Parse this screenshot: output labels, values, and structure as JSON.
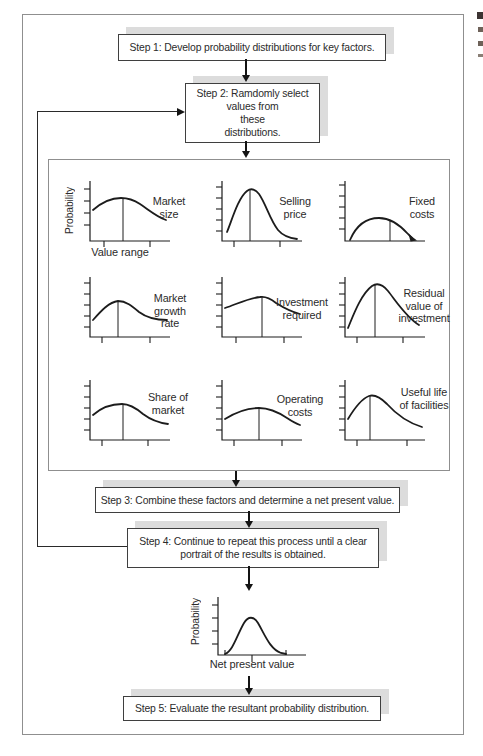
{
  "diagram": {
    "steps": [
      {
        "label": "Step 1: Develop probability distributions for key factors."
      },
      {
        "label": "Step 2: Ramdomly select\nvalues from\nthese\ndistributions."
      },
      {
        "label": "Step 3: Combine these factors and determine a net present value."
      },
      {
        "label": "Step 4: Continue to repeat this process until a clear\nportrait of the results is obtained."
      },
      {
        "label": "Step 5: Evaluate the resultant probability distribution."
      }
    ],
    "colors": {
      "line": "#1c1c1c",
      "box_border": "#3f3f3f",
      "frame": "#8f8f8f",
      "shadow": "#dcdcdc",
      "text": "#2b2b2b"
    }
  },
  "chart_data": {
    "factor_charts": {
      "type": "line",
      "ylabel": "Probability",
      "xlabel": "Value range",
      "items": [
        {
          "label": "Market\nsize",
          "path": "M 15,33 C 23,26 33,21 43,21 C 51,21 56,23 62,27 C 71,33 79,40 88,43",
          "vline": [
            45,
            21
          ],
          "yticks": [
            12,
            24,
            36,
            48
          ],
          "xticks": [
            26,
            72
          ]
        },
        {
          "label": "Selling\nprice",
          "path": "M 17,55 C 22,43 28,21 37,14 C 41,11 45,12 49,17 C 56,27 60,43 68,53 C 73,59 79,61 87,62",
          "vline": [
            40,
            13
          ],
          "yticks": [
            10,
            21,
            32,
            43,
            54
          ],
          "xticks": [
            24,
            70
          ]
        },
        {
          "label": "Fixed\ncosts",
          "path": "M 17,63 C 23,49 33,41 46,41 C 57,41 66,47 75,57 L 79,61",
          "vline": [
            57,
            43
          ],
          "yticks": [
            8,
            19,
            30,
            41,
            52
          ],
          "xticks": [],
          "end_arrow": "84,63.5 75.5,57 77.5,64.5"
        },
        {
          "label": "Market\ngrowth\nrate",
          "path": "M 15,47 C 23,38 31,29 40,28 C 48,28 54,33 61,39 C 69,45 79,47 89,47",
          "vline": [
            40,
            28
          ],
          "yticks": [
            10,
            21,
            32,
            43,
            54
          ],
          "xticks": [
            24,
            72
          ]
        },
        {
          "label": "Investment\nrequired",
          "path": "M 15,35 C 27,31 39,25 50,24 C 56,23 61,26 66,30 C 74,35 82,39 90,41",
          "vline": [
            52,
            24
          ],
          "yticks": [
            10,
            21,
            32,
            43,
            54
          ],
          "xticks": [
            26,
            74
          ]
        },
        {
          "label": "Residual\nvalue of\ninvestment",
          "path": "M 15,55 C 20,43 28,21 39,13 C 45,9 50,12 55,18 C 63,28 73,44 86,52",
          "vline": [
            42,
            12
          ],
          "yticks": [
            10,
            21,
            32,
            43,
            54
          ],
          "xticks": [
            24,
            70
          ]
        },
        {
          "label": "Share of\nmarket",
          "path": "M 15,39 C 24,31 34,28 44,28 C 52,28 58,32 65,38 C 73,44 82,47 90,48",
          "vline": [
            45,
            28
          ],
          "yticks": [
            10,
            21,
            32,
            43,
            54
          ],
          "xticks": [
            24,
            70
          ]
        },
        {
          "label": "Operating\ncosts",
          "path": "M 15,43 C 26,36 38,32 49,32 C 59,32 68,36 77,42 C 83,46 87,48 90,49",
          "vline": [
            49,
            32
          ],
          "yticks": [
            10,
            21,
            32,
            43,
            54
          ],
          "xticks": [
            24,
            72
          ]
        },
        {
          "label": "Useful life\nof facilities",
          "path": "M 15,43 C 21,33 28,23 36,20 C 42,18 48,22 54,28 C 63,38 76,47 89,51",
          "vline": [
            37,
            20
          ],
          "yticks": [
            10,
            21,
            32,
            43,
            54
          ],
          "xticks": [
            24,
            74
          ]
        }
      ]
    },
    "result_chart": {
      "type": "line",
      "ylabel": "Probability",
      "xlabel": "Net present value",
      "w": 110,
      "h": 80,
      "ox": 14,
      "oy": 62,
      "xend": 102,
      "ytop": 4,
      "yticks": [
        12,
        25,
        38,
        51
      ],
      "xticks": [],
      "bottom_tick": 48,
      "edge_ticks": [
        21,
        82
      ],
      "path": "M 21,61 C 29,58 33,42 40,30 C 44,23 50,23 54,30 C 61,42 66,56 77,60 L 82,61"
    }
  }
}
